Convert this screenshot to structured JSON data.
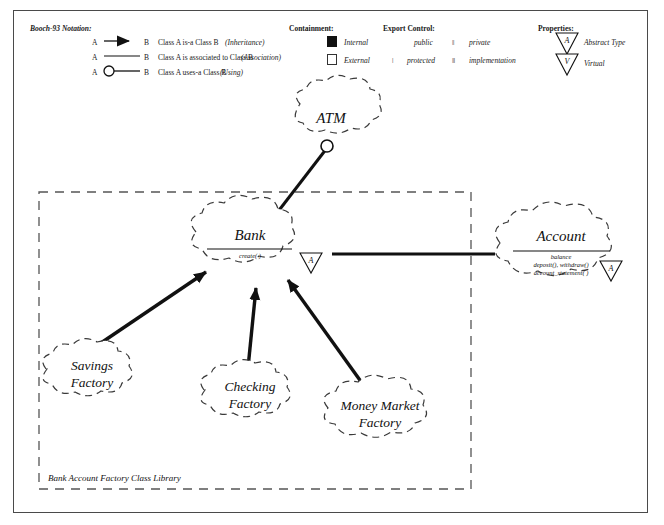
{
  "legend": {
    "notation_title": "Booch-93 Notation:",
    "relations": [
      {
        "from": "A",
        "to": "B",
        "desc": "Class A  is-a  Class B",
        "kind": "(Inheritance)",
        "symbol": "filled-arrow"
      },
      {
        "from": "A",
        "to": "B",
        "desc": "Class A  is associated to  Class B",
        "kind": "(Association)",
        "symbol": "plain-line"
      },
      {
        "from": "A",
        "to": "B",
        "desc": "Class A  uses-a  Class B",
        "kind": "(Using)",
        "symbol": "open-circle-line"
      }
    ],
    "containment": {
      "title": "Containment:",
      "items": [
        {
          "label": "Internal",
          "symbol": "filled-square"
        },
        {
          "label": "External",
          "symbol": "open-square"
        }
      ]
    },
    "export_control": {
      "title": "Export Control:",
      "items": [
        {
          "label": "public",
          "symbol": ""
        },
        {
          "label": "private",
          "symbol": "||"
        },
        {
          "label": "protected",
          "symbol": "|"
        },
        {
          "label": "implementation",
          "symbol": "|||"
        }
      ]
    },
    "properties": {
      "title": "Properties:",
      "items": [
        {
          "label": "Abstract Type",
          "symbol": "A",
          "shape": "inverted-triangle"
        },
        {
          "label": "Virtual",
          "symbol": "V",
          "shape": "inverted-triangle"
        }
      ]
    }
  },
  "diagram": {
    "library_label": "Bank Account Factory Class Library",
    "classes": [
      {
        "id": "atm",
        "name": "ATM",
        "members": [],
        "property": ""
      },
      {
        "id": "bank",
        "name": "Bank",
        "members": [
          "create( )"
        ],
        "property": "A"
      },
      {
        "id": "account",
        "name": "Account",
        "members": [
          "balance",
          "deposit(), withdraw()",
          "account_statement( )"
        ],
        "property": "A"
      },
      {
        "id": "savings",
        "name": "Savings Factory",
        "line1": "Savings",
        "line2": "Factory",
        "members": [],
        "property": ""
      },
      {
        "id": "checking",
        "name": "Checking Factory",
        "line1": "Checking",
        "line2": "Factory",
        "members": [],
        "property": ""
      },
      {
        "id": "money_market",
        "name": "Money Market Factory",
        "line1": "Money Market",
        "line2": "Factory",
        "members": [],
        "property": ""
      }
    ],
    "relationships": [
      {
        "from": "atm",
        "to": "bank",
        "type": "Using"
      },
      {
        "from": "bank",
        "to": "account",
        "type": "Association"
      },
      {
        "from": "savings",
        "to": "bank",
        "type": "Inheritance"
      },
      {
        "from": "checking",
        "to": "bank",
        "type": "Inheritance"
      },
      {
        "from": "money_market",
        "to": "bank",
        "type": "Inheritance"
      }
    ]
  },
  "colors": {
    "ink": "#111111",
    "frame": "#4a4a4a",
    "cloud_stroke": "#333333"
  }
}
